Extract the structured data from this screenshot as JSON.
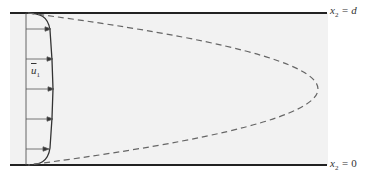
{
  "diagram": {
    "type": "channel flow velocity profile",
    "colors": {
      "background": "#ffffff",
      "channel_fill": "#f2f2f2",
      "walls": "#222222",
      "profile": "#333333",
      "dashed_curve": "#666666",
      "arrows": "#555555"
    },
    "labels": {
      "top_wall": {
        "var": "x",
        "sub": "2",
        "rel": " = ",
        "value": "d"
      },
      "bottom_wall": {
        "var": "x",
        "sub": "2",
        "rel": " = ",
        "value": "0"
      },
      "mean_velocity": {
        "var": "u",
        "sub": "1"
      }
    },
    "arrows_y": [
      29,
      59,
      89,
      119,
      149
    ]
  }
}
